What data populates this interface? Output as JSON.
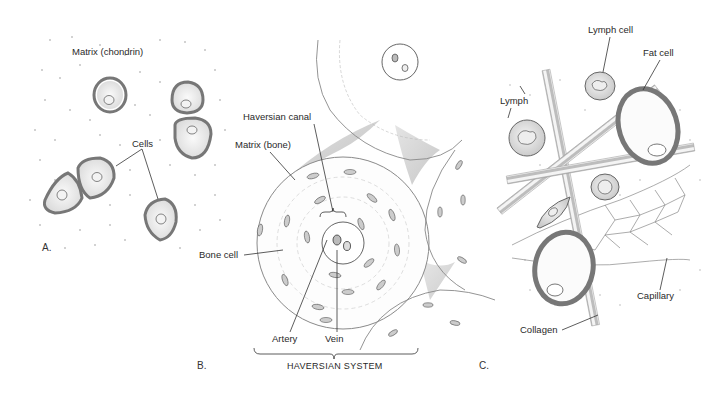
{
  "figure": {
    "panels": [
      {
        "id": "A",
        "panel_label": "A.",
        "subject": "cartilage",
        "labels": {
          "matrix": "Matrix (chondrin)",
          "cells": "Cells"
        }
      },
      {
        "id": "B",
        "panel_label": "B.",
        "subject": "bone",
        "labels": {
          "haversian_canal": "Haversian canal",
          "matrix": "Matrix (bone)",
          "bone_cell": "Bone cell",
          "artery": "Artery",
          "vein": "Vein",
          "system": "HAVERSIAN SYSTEM"
        }
      },
      {
        "id": "C",
        "panel_label": "C.",
        "subject": "connective tissue",
        "labels": {
          "lymph_cell": "Lymph cell",
          "fat_cell": "Fat cell",
          "lymph": "Lymph",
          "capillary": "Capillary",
          "collagen": "Collagen"
        }
      }
    ],
    "colors": {
      "ink": "#2a2a2a",
      "cell_outline": "#777777",
      "shading": "#bbbbbb",
      "background": "#ffffff"
    }
  }
}
